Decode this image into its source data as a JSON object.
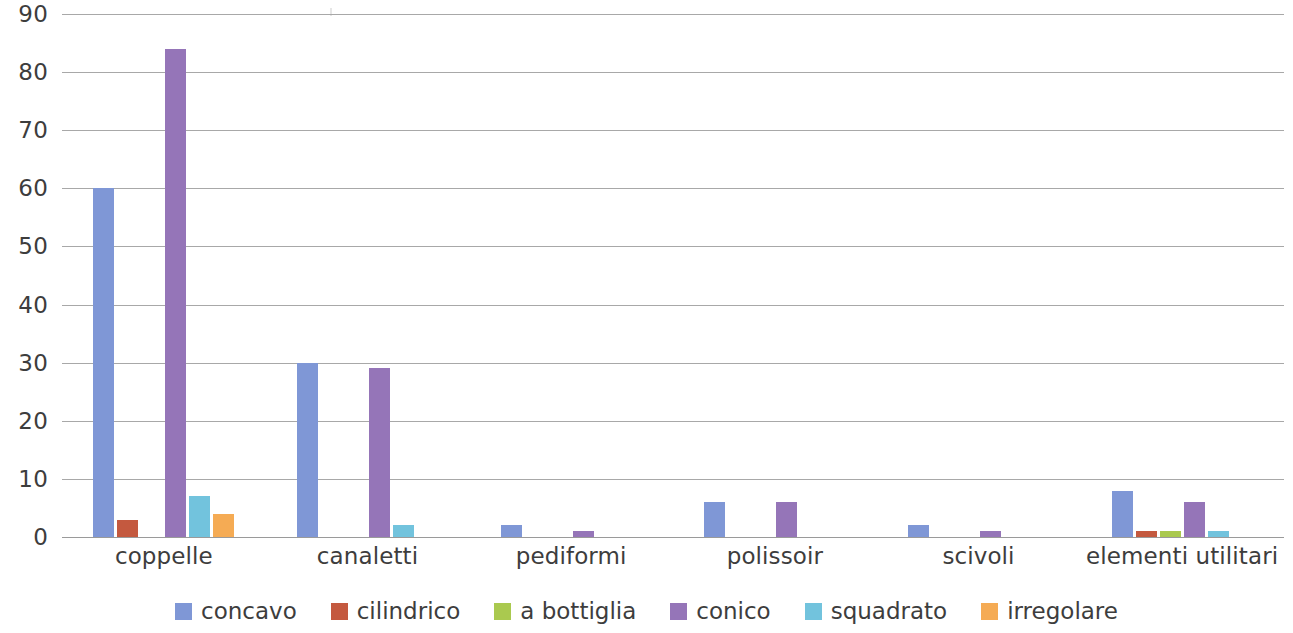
{
  "chart_data": {
    "type": "bar",
    "title": "",
    "subtitle": "",
    "xlabel": "",
    "ylabel": "",
    "ylim": [
      0,
      90
    ],
    "ytick_step": 10,
    "yticks": [
      0,
      10,
      20,
      30,
      40,
      50,
      60,
      70,
      80,
      90
    ],
    "ytick_labels": [
      "0",
      "10",
      "20",
      "30",
      "40",
      "50",
      "60",
      "70",
      "80",
      "90"
    ],
    "grid": true,
    "grid_axis": "y",
    "legend_position": "bottom",
    "grouping": "grouped",
    "categories": [
      "coppelle",
      "canaletti",
      "pediformi",
      "polissoir",
      "scivoli",
      "elementi utilitari"
    ],
    "series": [
      {
        "name": "concavo",
        "color": "#7f97d6",
        "values": [
          60,
          30,
          2,
          6,
          2,
          8
        ]
      },
      {
        "name": "cilindrico",
        "color": "#c4593f",
        "values": [
          3,
          0,
          0,
          0,
          0,
          1
        ]
      },
      {
        "name": "a bottiglia",
        "color": "#a8c martial",
        "values": [
          0,
          0,
          0,
          0,
          0,
          1
        ]
      },
      {
        "name": "conico",
        "color": "#9575b8",
        "values": [
          84,
          29,
          1,
          6,
          1,
          6
        ]
      },
      {
        "name": "squadrato",
        "color": "#72c3dd",
        "values": [
          7,
          2,
          0,
          0,
          0,
          1
        ]
      },
      {
        "name": "irregolare",
        "color": "#f5ab54",
        "values": [
          4,
          0,
          0,
          0,
          0,
          0
        ]
      }
    ],
    "colors": {
      "concavo": "#7f97d6",
      "cilindrico": "#c4593f",
      "a bottiglia": "#a7c martial",
      "conico": "#9575b8",
      "squadrato": "#72c3dd",
      "irregolare": "#f5ab54",
      "gridline": "#a8a8a8",
      "text": "#3d3d3d",
      "background": "#ffffff"
    }
  },
  "legend": {
    "items": [
      {
        "label": "concavo",
        "color": "#7f97d6"
      },
      {
        "label": "cilindrico",
        "color": "#c4593f"
      },
      {
        "label": "a bottiglia",
        "color": "#aac94f"
      },
      {
        "label": "conico",
        "color": "#9575b8"
      },
      {
        "label": "squadrato",
        "color": "#72c3dd"
      },
      {
        "label": "irregolare",
        "color": "#f5ab54"
      }
    ]
  }
}
